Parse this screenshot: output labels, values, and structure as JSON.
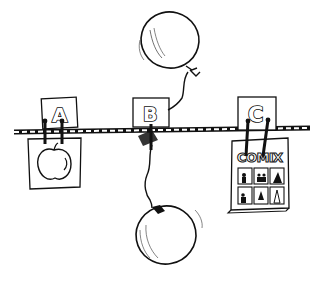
{
  "scene": {
    "description": "Hand-drawn illustration of a clothesline with three labeled cards clipped to it",
    "line_color": "#111111",
    "background": "#ffffff"
  },
  "cards": [
    {
      "label": "A",
      "attached_item": "apple"
    },
    {
      "label": "B",
      "attached_item": "two balloons on strings"
    },
    {
      "label": "C",
      "attached_item": "comic book"
    }
  ],
  "comic": {
    "title": "COMIX"
  }
}
